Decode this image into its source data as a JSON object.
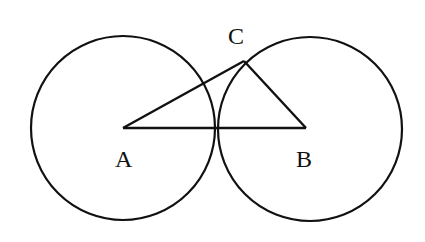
{
  "diagram": {
    "type": "geometry",
    "points": {
      "A": {
        "label": "A",
        "x": 123,
        "y": 128
      },
      "B": {
        "label": "B",
        "x": 306,
        "y": 128
      },
      "C": {
        "label": "C",
        "x": 244,
        "y": 61
      }
    },
    "circles": [
      {
        "name": "circle-A",
        "center": "A",
        "cx": 123,
        "cy": 128,
        "r": 92
      },
      {
        "name": "circle-B",
        "center": "B",
        "cx": 310,
        "cy": 128,
        "r": 92
      }
    ],
    "segments": [
      [
        "A",
        "B"
      ],
      [
        "A",
        "C"
      ],
      [
        "B",
        "C"
      ]
    ],
    "stroke_color": "#111111"
  }
}
